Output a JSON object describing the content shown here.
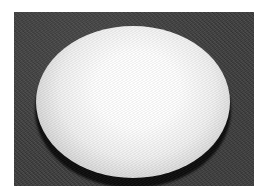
{
  "image": {
    "subject": "white egg on dark textured surface",
    "style": "grayscale photograph",
    "colors": {
      "background": "#3d3d3d",
      "egg_highlight": "#ffffff",
      "egg_shadow": "#0c0c0c",
      "page": "#ffffff"
    }
  }
}
